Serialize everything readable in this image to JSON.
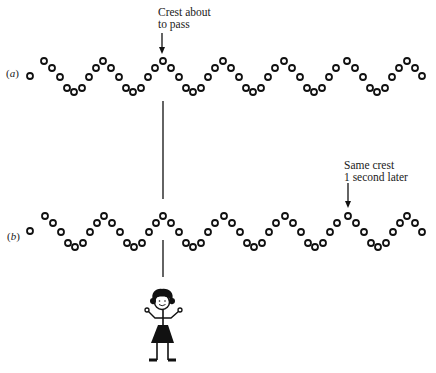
{
  "figure": {
    "rows": [
      {
        "id": "a",
        "label_prefix": "(",
        "label_letter": "a",
        "label_suffix": ")",
        "crest_y": 61,
        "crests_x": [
          44,
          103,
          163,
          223,
          284,
          347,
          407
        ],
        "first_circle": {
          "x": 30,
          "y": 76
        },
        "last_circle": {
          "x": 422,
          "y": 76
        }
      },
      {
        "id": "b",
        "label_prefix": "(",
        "label_letter": "b",
        "label_suffix": ")",
        "crest_y": 216,
        "crests_x": [
          45,
          104,
          163,
          224,
          285,
          348,
          407
        ],
        "first_circle": {
          "x": 30,
          "y": 231
        },
        "last_circle": {
          "x": 422,
          "y": 232
        }
      }
    ],
    "wave_pattern": {
      "circles_per_period": 8,
      "offsets": [
        [
          0,
          0
        ],
        [
          8,
          7
        ],
        [
          16,
          16
        ],
        [
          23,
          27
        ],
        [
          30,
          31
        ],
        [
          38,
          27
        ],
        [
          45,
          16
        ],
        [
          52,
          7
        ]
      ],
      "circle_radius": 3,
      "stroke_width": 1.8,
      "color": "#111111"
    },
    "annotations": [
      {
        "id": "crest-about-to-pass",
        "lines": [
          "Crest about",
          "to pass"
        ],
        "x": 158,
        "y": 7,
        "arrow": {
          "x": 162,
          "y1": 33,
          "y2": 54
        }
      },
      {
        "id": "same-crest-later",
        "lines": [
          "Same crest",
          "1 second later"
        ],
        "x": 344,
        "y": 160,
        "arrow": {
          "x": 348,
          "y1": 183,
          "y2": 208
        }
      }
    ],
    "observer_line": {
      "x": 163,
      "segments": [
        [
          101,
          199
        ],
        [
          240,
          277
        ]
      ]
    },
    "observer": {
      "type": "stick-figure-girl",
      "head": {
        "x": 162,
        "y": 301,
        "r": 8
      }
    }
  }
}
